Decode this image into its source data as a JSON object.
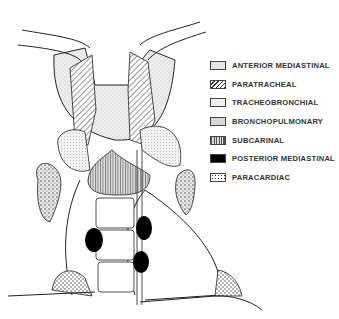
{
  "diagram": {
    "legend": [
      {
        "label": "ANTERIOR MEDIASTINAL",
        "pattern": "fine-stipple"
      },
      {
        "label": "PARATRACHEAL",
        "pattern": "diagonal-hatch"
      },
      {
        "label": "TRACHEOBRONCHIAL",
        "pattern": "light-stipple"
      },
      {
        "label": "BRONCHOPULMONARY",
        "pattern": "coarse-stipple"
      },
      {
        "label": "SUBCARINAL",
        "pattern": "vertical-lines"
      },
      {
        "label": "POSTERIOR MEDIASTINAL",
        "pattern": "solid-black"
      },
      {
        "label": "PARACARDIAC",
        "pattern": "dots"
      }
    ]
  }
}
